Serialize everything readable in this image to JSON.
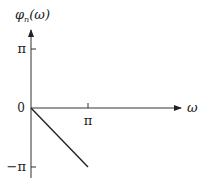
{
  "chart_data": {
    "type": "line",
    "title": "",
    "xlabel": "ω",
    "ylabel": "φ",
    "ylabel_subscript": "n",
    "ylabel_arg": "(ω)",
    "xlim_pi": [
      0,
      2.4
    ],
    "ylim_pi": [
      -1.2,
      1.4
    ],
    "x_ticks": [
      {
        "value_pi": 1,
        "label": "π"
      }
    ],
    "y_ticks": [
      {
        "value_pi": 1,
        "label": "π"
      },
      {
        "value_pi": -1,
        "label": "−π"
      }
    ],
    "origin_label": "0",
    "grid": false,
    "legend": null,
    "series": [
      {
        "name": "phase",
        "points_pi": [
          [
            0,
            0
          ],
          [
            1,
            -1
          ]
        ],
        "color": "#222222"
      }
    ]
  }
}
